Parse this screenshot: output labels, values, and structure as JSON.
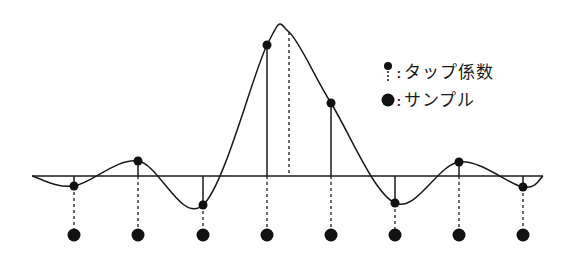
{
  "diagram": {
    "type": "sinc-interpolation-fir",
    "baseline_y": 176,
    "baseline_x_range": [
      32,
      543
    ],
    "sample_row_y": 235,
    "peak": {
      "x": 289,
      "y": 32
    },
    "taps": [
      {
        "x": 74,
        "y": 186
      },
      {
        "x": 138,
        "y": 161
      },
      {
        "x": 203,
        "y": 205
      },
      {
        "x": 267,
        "y": 45
      },
      {
        "x": 331,
        "y": 103
      },
      {
        "x": 395,
        "y": 203
      },
      {
        "x": 459,
        "y": 162
      },
      {
        "x": 523,
        "y": 187
      }
    ],
    "colors": {
      "line": "#1a1a1a",
      "dot": "#111111",
      "background": "#ffffff"
    }
  },
  "legend": {
    "items": [
      {
        "icon": "tap-coefficient-icon",
        "separator": ":",
        "label": "タップ係数"
      },
      {
        "icon": "sample-dot-icon",
        "separator": ":",
        "label": "サンプル"
      }
    ]
  }
}
